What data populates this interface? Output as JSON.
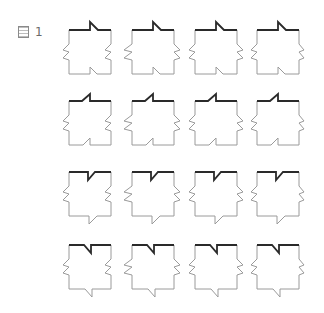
{
  "figure": {
    "label_prefix": "図",
    "label_number": "1"
  },
  "grid": {
    "columns": 4,
    "rows": 4,
    "col_x": [
      69,
      132,
      195,
      257
    ],
    "row_y": [
      30,
      101,
      172,
      245
    ],
    "width": 42,
    "height": 44
  },
  "colors": {
    "outline": "#9a9a9a",
    "highlighted_edge": "#2a2a2a",
    "label": "#6a6a6a"
  },
  "shapes": {
    "row_variants": [
      {
        "name": "peak-right-top-notch-bottom-up-right",
        "top": "peak_slant_right",
        "bottom": "notch_up_slant_right"
      },
      {
        "name": "peak-left-top-notch-bottom-up-left",
        "top": "peak_slant_left",
        "bottom": "notch_up_slant_left"
      },
      {
        "name": "notch-down-top-point-bottom-right",
        "top": "notch_down_slant_right",
        "bottom": "point_down_slant_right"
      },
      {
        "name": "notch-down-top-point-bottom-left",
        "top": "notch_down_slant_left",
        "bottom": "point_down_slant_left"
      }
    ],
    "column_variants": [
      {
        "left": "zig_out",
        "right": "zig_in"
      },
      {
        "left": "zig_out_deep",
        "right": "zig_out"
      },
      {
        "left": "zig_out",
        "right": "zig_out"
      },
      {
        "left": "zig_out",
        "right": "zig_out_small"
      }
    ]
  }
}
